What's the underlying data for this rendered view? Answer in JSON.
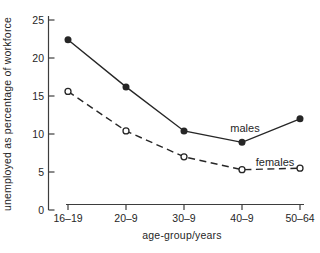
{
  "figure": {
    "background": "#ffffff",
    "ink_color": "#262626"
  },
  "chart_data": {
    "type": "line",
    "title": "",
    "xlabel": "age-group/years",
    "ylabel": "unemployed as percentage of workforce",
    "categories": [
      "16–19",
      "20–9",
      "30–9",
      "40–9",
      "50–64"
    ],
    "y_ticks": [
      0,
      5,
      10,
      15,
      20,
      25
    ],
    "ylim": [
      0,
      25
    ],
    "grid": false,
    "legend_position": "inline labels beside each line",
    "series": [
      {
        "name": "males",
        "label": "males",
        "line_style": "solid",
        "marker": "filled-circle",
        "values": [
          22.4,
          16.2,
          10.4,
          8.9,
          12.0
        ]
      },
      {
        "name": "females",
        "label": "females",
        "line_style": "dashed",
        "marker": "open-circle",
        "values": [
          15.6,
          10.4,
          7.0,
          5.3,
          5.5
        ]
      }
    ]
  }
}
